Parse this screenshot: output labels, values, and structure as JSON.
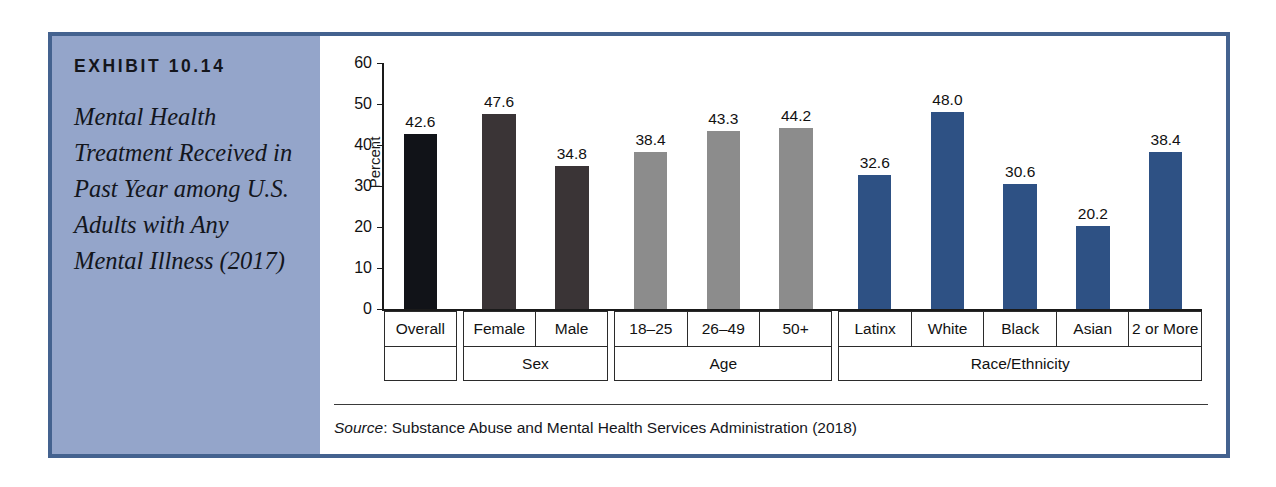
{
  "exhibit": {
    "number": "EXHIBIT 10.14",
    "title": "Mental Health Treatment Received in Past Year among U.S. Adults with Any Mental Illness (2017)"
  },
  "source": {
    "label": "Source",
    "separator": ": ",
    "text": "Substance Abuse and Mental Health Services Administration (2018)"
  },
  "colors": {
    "frame_border": "#44628f",
    "caption_background": "#94a5ca",
    "bar_overall": "#111318",
    "bar_sex": "#3a3436",
    "bar_age": "#8c8c8c",
    "bar_race": "#2e5184",
    "axis": "#1a1a1a",
    "table_border": "#2b2b2b"
  },
  "chart_data": {
    "type": "bar",
    "title": "Mental Health Treatment Received in Past Year among U.S. Adults with Any Mental Illness (2017)",
    "xlabel": "",
    "ylabel": "Percent",
    "ylim": [
      0,
      60
    ],
    "yticks": [
      0,
      10,
      20,
      30,
      40,
      50,
      60
    ],
    "ytick_labels": [
      "0",
      "10",
      "20",
      "30",
      "40",
      "50",
      "60"
    ],
    "grid": false,
    "legend": "none",
    "categories": [
      "Overall",
      "Female",
      "Male",
      "18–25",
      "26–49",
      "50+",
      "Latinx",
      "White",
      "Black",
      "Asian",
      "2 or More"
    ],
    "values": [
      42.6,
      47.6,
      34.8,
      38.4,
      43.3,
      44.2,
      32.6,
      48.0,
      30.6,
      20.2,
      38.4
    ],
    "value_labels": [
      "42.6",
      "47.6",
      "34.8",
      "38.4",
      "43.3",
      "44.2",
      "32.6",
      "48.0",
      "30.6",
      "20.2",
      "38.4"
    ],
    "bar_colors": [
      "#111318",
      "#3a3436",
      "#3a3436",
      "#8c8c8c",
      "#8c8c8c",
      "#8c8c8c",
      "#2e5184",
      "#2e5184",
      "#2e5184",
      "#2e5184",
      "#2e5184"
    ],
    "groups": [
      {
        "name": "",
        "categories": [
          "Overall"
        ],
        "values": [
          42.6
        ]
      },
      {
        "name": "Sex",
        "categories": [
          "Female",
          "Male"
        ],
        "values": [
          47.6,
          34.8
        ]
      },
      {
        "name": "Age",
        "categories": [
          "18–25",
          "26–49",
          "50+"
        ],
        "values": [
          38.4,
          43.3,
          44.2
        ]
      },
      {
        "name": "Race/Ethnicity",
        "categories": [
          "Latinx",
          "White",
          "Black",
          "Asian",
          "2 or More"
        ],
        "values": [
          32.6,
          48.0,
          30.6,
          20.2,
          38.4
        ]
      }
    ]
  }
}
